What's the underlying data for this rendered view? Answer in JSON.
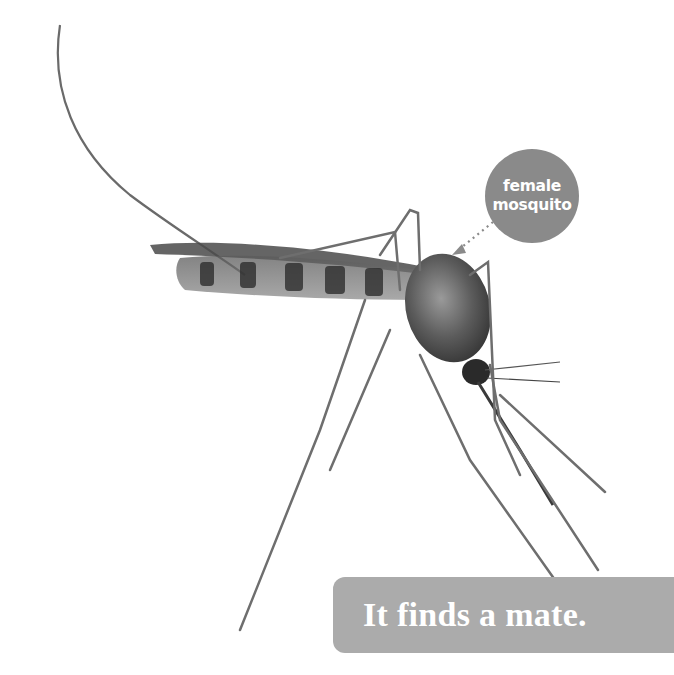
{
  "page": {
    "background_color": "#ffffff"
  },
  "illustration": {
    "subject": "mosquito-photo",
    "label": {
      "line1": "female",
      "line2": "mosquito",
      "color": "#8a8a8a"
    }
  },
  "caption": {
    "text": "It finds a mate.",
    "background_color": "#ababab"
  }
}
